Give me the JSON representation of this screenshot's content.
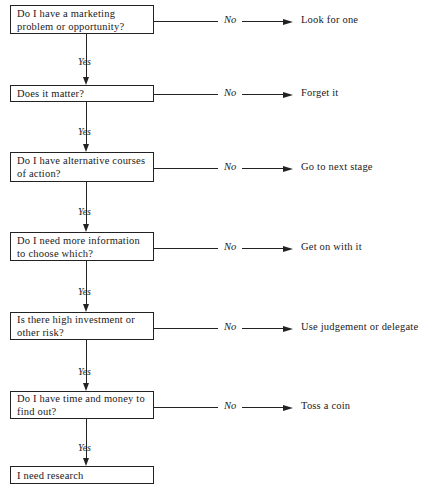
{
  "diagram": {
    "type": "decision-flowchart",
    "yes_label": "Yes",
    "no_label": "No",
    "steps": [
      {
        "question": "Do I have a marketing problem or opportunity?",
        "no_outcome": "Look for one"
      },
      {
        "question": "Does it matter?",
        "no_outcome": "Forget it"
      },
      {
        "question": "Do I have alternative courses of action?",
        "no_outcome": "Go to next stage"
      },
      {
        "question": "Do I need more information to choose which?",
        "no_outcome": "Get on with it"
      },
      {
        "question": "Is there high investment or other risk?",
        "no_outcome": "Use judgement or delegate"
      },
      {
        "question": "Do I have time and money to find out?",
        "no_outcome": "Toss a coin"
      }
    ],
    "final": "I need research"
  },
  "colors": {
    "line": "#222222",
    "background": "#ffffff",
    "text": "#1a1a1a"
  }
}
